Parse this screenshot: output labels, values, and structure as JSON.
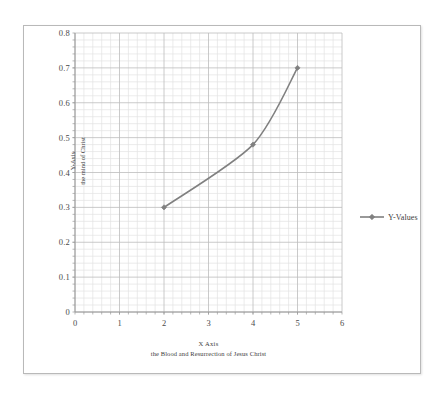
{
  "chart_data": {
    "type": "line",
    "title": "",
    "xlabel": "X Axis",
    "xlabel_sub": "the Blood and Resurrection of Jesus Christ",
    "ylabel": "Y-Axis",
    "ylabel_sub": "the mind of Christ",
    "series": [
      {
        "name": "Y-Values",
        "x": [
          2,
          4,
          5
        ],
        "values": [
          0.3,
          0.48,
          0.7
        ],
        "color": "#808080",
        "marker": "diamond",
        "smooth": true
      }
    ],
    "xlim": [
      0,
      6
    ],
    "ylim": [
      0,
      0.8
    ],
    "xticks": [
      "0",
      "1",
      "2",
      "3",
      "4",
      "5",
      "6"
    ],
    "xtick_values": [
      0,
      1,
      2,
      3,
      4,
      5,
      6
    ],
    "yticks": [
      "0",
      "0.1",
      "0.2",
      "0.3",
      "0.4",
      "0.5",
      "0.6",
      "0.7",
      "0.8"
    ],
    "ytick_values": [
      0,
      0.1,
      0.2,
      0.3,
      0.4,
      0.5,
      0.6,
      0.7,
      0.8
    ],
    "grid": {
      "major": true,
      "minor": true,
      "minor_x_divisions": 5,
      "minor_y_divisions": 5,
      "major_color": "#bdbdbd",
      "minor_color": "#e3e3e3"
    },
    "legend": {
      "position": "right",
      "entries": [
        "Y-Values"
      ]
    },
    "axis_line_color": "#9a9a9a",
    "frame_color": "#b9b9b9",
    "background": "#ffffff"
  },
  "legend": {
    "label": "Y-Values"
  },
  "axes": {
    "x_title_line1": "X Axis",
    "x_title_line2": "the Blood and Resurrection of Jesus Christ",
    "y_title_line1": "Y-Axis",
    "y_title_line2": "the mind of Christ"
  }
}
